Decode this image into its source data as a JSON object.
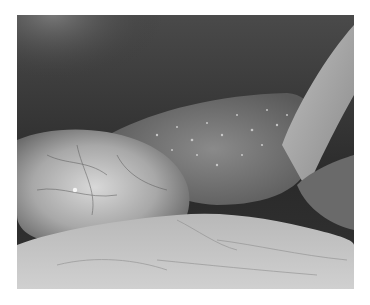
{
  "image": {
    "kind": "grayscale laparoscopic / endoscopic photograph",
    "content": "internal abdominal tissue: dark upper cavity, bumpy glistening organ surface in center, smooth veined tissue on left, fatty folded tissue along bottom, tubular structure upper right",
    "palette": {
      "dark": "#262626",
      "mid": "#6e6e6e",
      "light": "#c8c8c8",
      "highlight": "#f2f2f2"
    }
  }
}
